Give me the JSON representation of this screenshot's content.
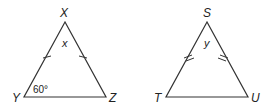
{
  "triangles": [
    {
      "id": "XYZ",
      "vertices": {
        "top": "X",
        "left": "Y",
        "right": "Z"
      },
      "apex_angle_label": "x",
      "base_angle_label": "60°",
      "congruent_sides_ticks": 1
    },
    {
      "id": "STU",
      "vertices": {
        "top": "S",
        "left": "T",
        "right": "U"
      },
      "apex_angle_label": "y",
      "congruent_sides_ticks": 2
    }
  ],
  "colors": {
    "stroke": "#333333",
    "text": "#222222"
  }
}
